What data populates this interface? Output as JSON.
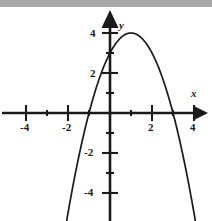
{
  "figure": {
    "background_color": "#ffffff",
    "ink_color": "#1a1a1a",
    "top_band_color": "#a8a8a8"
  },
  "axes": {
    "x_name": "x",
    "y_name": "y",
    "x_tick_labels": [
      {
        "text": "-4",
        "value": -4,
        "px": 26,
        "py": 128
      },
      {
        "text": "-2",
        "value": -2,
        "px": 68,
        "py": 128
      },
      {
        "text": "2",
        "value": 2,
        "px": 150,
        "py": 128
      },
      {
        "text": "4",
        "value": 4,
        "px": 191,
        "py": 128
      }
    ],
    "y_tick_labels": [
      {
        "text": "4",
        "value": 4,
        "px": 92,
        "py": 30
      },
      {
        "text": "2",
        "value": 2,
        "px": 92,
        "py": 70
      },
      {
        "text": "-2",
        "value": -2,
        "px": 88,
        "py": 150
      },
      {
        "text": "-4",
        "value": -4,
        "px": 88,
        "py": 190
      }
    ],
    "x_name_pos": {
      "px": 192,
      "py": 93
    },
    "y_name_pos": {
      "px": 120,
      "py": 22
    }
  },
  "chart_data": {
    "type": "line",
    "title": "",
    "xlabel": "x",
    "ylabel": "y",
    "xlim": [
      -5.2,
      4.85
    ],
    "ylim": [
      -5.4,
      5.05
    ],
    "grid": false,
    "legend": "none",
    "x_major_ticks": [
      -4,
      -2,
      2,
      4
    ],
    "x_minor_ticks": [
      -3,
      -1,
      1,
      3
    ],
    "y_major_ticks": [
      4,
      2,
      -2,
      -4
    ],
    "y_minor_ticks": [
      3,
      1,
      -1,
      -3
    ],
    "annotations": {
      "vertex": [
        1,
        -4
      ],
      "y_intercept": [
        0,
        -3
      ],
      "roots": [
        -1,
        3
      ]
    },
    "series": [
      {
        "name": "y = x^2 - 2x - 3",
        "kind": "parabola",
        "equation": "y = x^2 - 2x - 3",
        "coefficients": {
          "a": 1,
          "b": -2,
          "c": -3
        },
        "x": [
          -1.85,
          -1.6,
          -1.4,
          -1.2,
          -1.0,
          -0.8,
          -0.6,
          -0.4,
          -0.2,
          0.0,
          0.2,
          0.4,
          0.6,
          0.8,
          1.0,
          1.2,
          1.4,
          1.6,
          1.8,
          2.0,
          2.2,
          2.4,
          2.6,
          2.8,
          3.0,
          3.2,
          3.4,
          3.6,
          3.85
        ],
        "y": [
          4.12,
          2.76,
          1.76,
          0.84,
          0.0,
          -0.76,
          -1.44,
          -2.04,
          -2.56,
          -3.0,
          -3.36,
          -3.64,
          -3.84,
          -3.96,
          -4.0,
          -3.96,
          -3.84,
          -3.64,
          -3.36,
          -3.0,
          -2.56,
          -2.04,
          -1.44,
          -0.76,
          0.0,
          0.84,
          1.76,
          2.76,
          4.12
        ]
      }
    ]
  }
}
